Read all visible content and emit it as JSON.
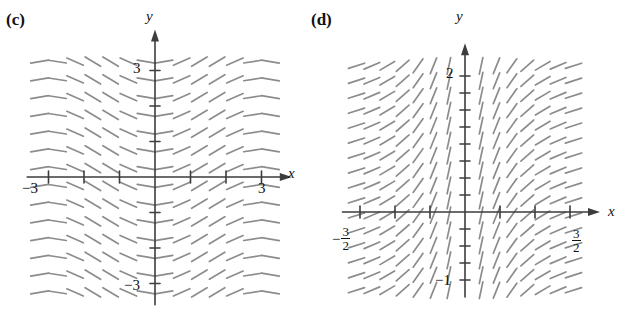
{
  "figure": {
    "background": "#ffffff",
    "axis_color": "#3d3d3d",
    "slope_color": "#8c8c8c",
    "text_color": "#111111"
  },
  "panels": [
    {
      "id": "c",
      "label": "(c)",
      "axis_labels": {
        "x": "x",
        "y": "y"
      },
      "origin": {
        "x": 155,
        "y": 177
      },
      "unit_px": {
        "x": 35.5,
        "y": 35.5
      },
      "x_axis": {
        "ticks": [
          -3,
          -2,
          -1,
          1,
          2,
          3
        ],
        "tick_labels": [
          {
            "value": -3,
            "text": "−3"
          },
          {
            "value": 3,
            "text": "3"
          }
        ],
        "range": [
          -3.6,
          3.6
        ],
        "arrow": "right"
      },
      "y_axis": {
        "ticks": [
          -3,
          -2,
          -1,
          1,
          2,
          3
        ],
        "tick_labels": [
          {
            "value": 3,
            "text": "3"
          },
          {
            "value": -3,
            "text": "−3"
          }
        ],
        "range": [
          -3.6,
          3.9
        ],
        "arrow": "up"
      },
      "chart_data": {
        "type": "slope_field",
        "title": "(c)",
        "xlabel": "x",
        "ylabel": "y",
        "xlim": [
          -3.6,
          3.6
        ],
        "ylim": [
          -3.6,
          3.9
        ],
        "grid": false,
        "legend": "none",
        "slope_expression": "dy/dx = sin(x)",
        "slope_model": "sine",
        "dash_length_px": 18,
        "grid_x": [
          -3.25,
          -2.75,
          -2.25,
          -1.75,
          -1.25,
          -0.75,
          -0.25,
          0.25,
          0.75,
          1.25,
          1.75,
          2.25,
          2.75,
          3.25
        ],
        "grid_y": [
          -3.25,
          -2.75,
          -2.25,
          -1.75,
          -1.25,
          -0.75,
          -0.25,
          0.25,
          0.75,
          1.25,
          1.75,
          2.25,
          2.75,
          3.25
        ],
        "description": "Slopes depend only on x: negative for x<0 far from origin, positive just right of origin, returning toward negative near x=3."
      }
    },
    {
      "id": "d",
      "label": "(d)",
      "axis_labels": {
        "x": "x",
        "y": "y"
      },
      "origin": {
        "x": 160,
        "y": 212
      },
      "unit_px": {
        "x": 70,
        "y": 68
      },
      "x_axis": {
        "ticks": [
          -1.5,
          -1,
          -0.5,
          0.5,
          1,
          1.5
        ],
        "tick_labels": [
          {
            "value": -1.5,
            "text": "−3/2",
            "numerator": "3",
            "denominator": "2",
            "negative": true
          },
          {
            "value": 1.5,
            "text": "3/2",
            "numerator": "3",
            "denominator": "2",
            "negative": false
          }
        ],
        "range": [
          -1.75,
          1.8
        ],
        "arrow": "right"
      },
      "y_axis": {
        "ticks": [
          -1,
          -0.75,
          -0.5,
          -0.25,
          0.25,
          0.5,
          0.75,
          1,
          1.25,
          1.5,
          1.75,
          2
        ],
        "tick_labels": [
          {
            "value": 2,
            "text": "2"
          },
          {
            "value": -1,
            "text": "−1"
          }
        ],
        "range": [
          -1.25,
          2.35
        ],
        "arrow": "up"
      },
      "chart_data": {
        "type": "slope_field",
        "title": "(d)",
        "xlabel": "x",
        "ylabel": "y",
        "xlim": [
          -1.75,
          1.8
        ],
        "ylim": [
          -1.25,
          2.35
        ],
        "grid": false,
        "legend": "none",
        "slope_expression": "dy/dx = 1/x",
        "slope_model": "reciprocal",
        "dash_length_px": 17,
        "grid_x": [
          -1.55,
          -1.33,
          -1.11,
          -0.89,
          -0.67,
          -0.45,
          -0.23,
          0.23,
          0.45,
          0.67,
          0.89,
          1.11,
          1.33,
          1.55
        ],
        "grid_y": [
          -1.15,
          -0.93,
          -0.71,
          -0.49,
          -0.27,
          -0.05,
          0.17,
          0.39,
          0.61,
          0.83,
          1.05,
          1.27,
          1.49,
          1.71,
          1.93,
          2.15
        ],
        "description": "Slopes depend only on x: nearly vertical far left, steeply positive near the y-axis, flattening toward horizontal as |x| grows on the right."
      }
    }
  ]
}
